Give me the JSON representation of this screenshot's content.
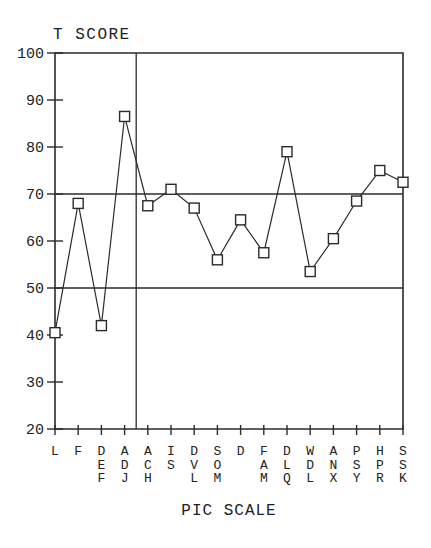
{
  "figure": {
    "kind": "scanned-profile-chart"
  },
  "chart_data": {
    "type": "line",
    "title": "T SCORE",
    "xlabel": "PIC SCALE",
    "ylabel": "T SCORE",
    "categories": [
      "L",
      "F",
      "DEF",
      "ADJ",
      "ACH",
      "IS",
      "DVL",
      "SOM",
      "D",
      "FAM",
      "DLQ",
      "WDL",
      "ANX",
      "PSY",
      "HPR",
      "SSK"
    ],
    "values": [
      40.5,
      68,
      42,
      86.5,
      67.5,
      71,
      67,
      56,
      64.5,
      57.5,
      79,
      53.5,
      60.5,
      68.5,
      75,
      72.5
    ],
    "ylim": [
      20,
      100
    ],
    "yticks": [
      100,
      90,
      80,
      70,
      60,
      50,
      40,
      30,
      20
    ],
    "reference_lines_y": [
      70,
      50
    ],
    "vertical_separator_after_category": "ADJ",
    "marker": "open-square",
    "grid": "off",
    "legend": "none",
    "ink_color": "#2b2b2b",
    "background_color": "#ffffff"
  }
}
